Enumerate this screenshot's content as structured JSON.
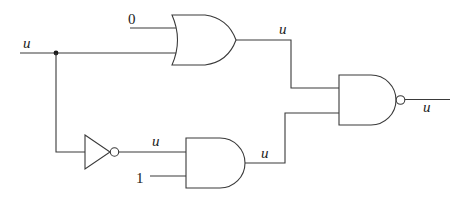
{
  "diagram": {
    "type": "logic-circuit",
    "gates": [
      {
        "id": "or1",
        "kind": "OR",
        "inputs": [
          "0",
          "u"
        ],
        "output": "u"
      },
      {
        "id": "not1",
        "kind": "NOT",
        "inputs": [
          "u"
        ],
        "output": "u"
      },
      {
        "id": "and1",
        "kind": "AND",
        "inputs": [
          "u",
          "1"
        ],
        "output": "u"
      },
      {
        "id": "nand1",
        "kind": "NAND",
        "inputs": [
          "or1",
          "and1"
        ],
        "output": "u"
      }
    ],
    "labels": {
      "input_main": "u",
      "or_const": "0",
      "or_out": "u",
      "not_out": "u",
      "and_const": "1",
      "and_out": "u",
      "nand_out": "u"
    },
    "colors": {
      "stroke": "#3a3a3a",
      "background": "#ffffff"
    }
  }
}
